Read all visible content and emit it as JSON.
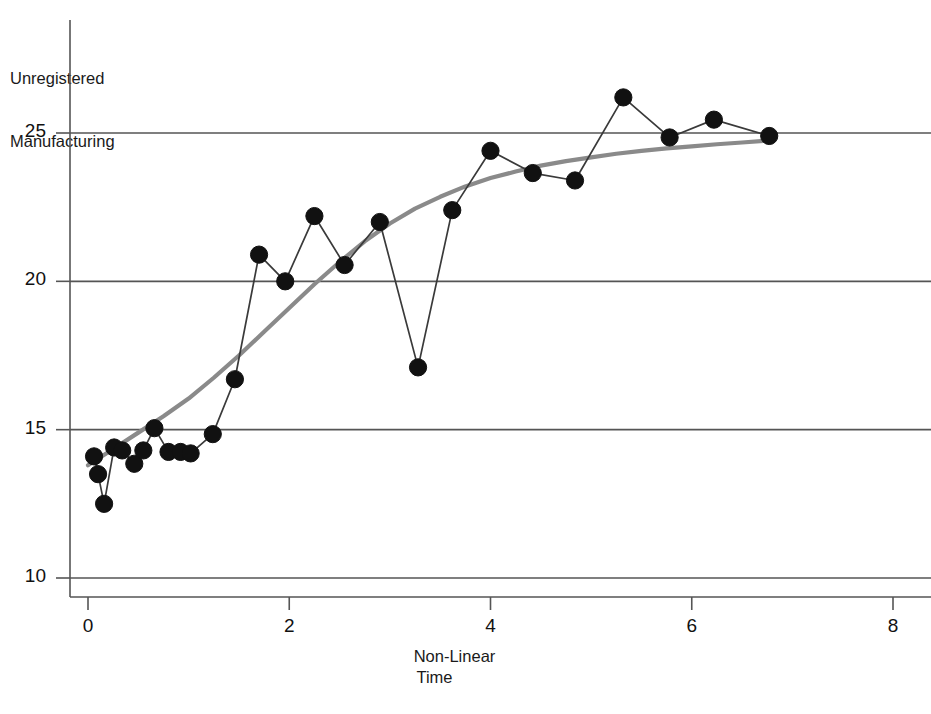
{
  "figure": {
    "top_cut_text": " ",
    "background_color": "#ffffff"
  },
  "axes": {
    "y_title_line1": "Unregistered",
    "y_title_line2": "Manufacturing",
    "x_title_line1": "Non-Linear",
    "x_title_line2": "Time",
    "y_ticks": [
      "10",
      "15",
      "20",
      "25"
    ],
    "x_ticks": [
      "0",
      "2",
      "4",
      "6",
      "8"
    ]
  },
  "chart_data": {
    "type": "scatter",
    "title": "",
    "subtitle": "",
    "xlabel": "Non-Linear Time",
    "ylabel": "Unregistered Manufacturing",
    "xlim": [
      0,
      8
    ],
    "ylim": [
      8.2,
      27.6
    ],
    "xticks": [
      0,
      2,
      4,
      6,
      8
    ],
    "yticks": [
      10,
      15,
      20,
      25
    ],
    "grid": "horizontal",
    "legend": "none",
    "point_color": "#111111",
    "line_color": "#3a3a3a",
    "smooth_color": "#8a8a8a",
    "grid_color": "#555555",
    "axis_color": "#555555",
    "series": [
      {
        "name": "Observed",
        "style": "markers-with-connecting-line",
        "marker": "filled-circle",
        "x": [
          0.06,
          0.1,
          0.16,
          0.26,
          0.34,
          0.46,
          0.55,
          0.66,
          0.8,
          0.92,
          1.02,
          1.24,
          1.46,
          1.7,
          1.96,
          2.25,
          2.55,
          2.9,
          3.28,
          3.62,
          4.0,
          4.42,
          4.84,
          5.32,
          5.78,
          6.22,
          6.77
        ],
        "y": [
          14.1,
          13.5,
          12.5,
          14.4,
          14.3,
          13.85,
          14.3,
          15.05,
          14.25,
          14.25,
          14.2,
          14.85,
          16.7,
          20.9,
          20.0,
          22.2,
          20.55,
          22.0,
          17.1,
          22.4,
          24.4,
          23.65,
          23.4,
          26.2,
          24.85,
          25.45,
          24.9
        ]
      },
      {
        "name": "Non-linear fit",
        "style": "smooth-curve",
        "marker": "none",
        "x": [
          0.0,
          0.25,
          0.5,
          0.75,
          1.0,
          1.25,
          1.5,
          1.75,
          2.0,
          2.25,
          2.5,
          2.75,
          3.0,
          3.25,
          3.5,
          3.75,
          4.0,
          4.25,
          4.5,
          4.75,
          5.0,
          5.25,
          5.5,
          5.75,
          6.0,
          6.25,
          6.5,
          6.77
        ],
        "y": [
          13.8,
          14.35,
          14.9,
          15.45,
          16.05,
          16.75,
          17.5,
          18.3,
          19.1,
          19.9,
          20.65,
          21.35,
          21.95,
          22.45,
          22.85,
          23.2,
          23.48,
          23.7,
          23.9,
          24.05,
          24.18,
          24.3,
          24.4,
          24.48,
          24.55,
          24.62,
          24.68,
          24.75
        ]
      }
    ]
  }
}
